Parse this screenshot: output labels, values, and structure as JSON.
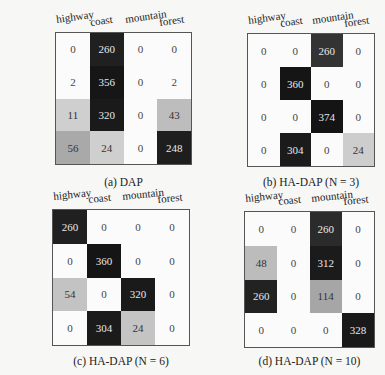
{
  "classes": [
    "highway",
    "coast",
    "mountain",
    "forest"
  ],
  "panels": [
    {
      "caption": "(a) DAP",
      "matrix": [
        [
          0,
          260,
          0,
          0
        ],
        [
          2,
          356,
          0,
          2
        ],
        [
          11,
          320,
          0,
          43
        ],
        [
          56,
          24,
          0,
          248
        ]
      ]
    },
    {
      "caption": "(b) HA-DAP (N = 3)",
      "matrix": [
        [
          0,
          0,
          260,
          0
        ],
        [
          0,
          360,
          0,
          0
        ],
        [
          0,
          0,
          374,
          0
        ],
        [
          0,
          304,
          0,
          24
        ]
      ]
    },
    {
      "caption": "(c) HA-DAP (N = 6)",
      "matrix": [
        [
          260,
          0,
          0,
          0
        ],
        [
          0,
          360,
          0,
          0
        ],
        [
          54,
          0,
          320,
          0
        ],
        [
          0,
          304,
          24,
          0
        ]
      ]
    },
    {
      "caption": "(d) HA-DAP (N = 10)",
      "matrix": [
        [
          0,
          0,
          260,
          0
        ],
        [
          48,
          0,
          312,
          0
        ],
        [
          260,
          0,
          114,
          0
        ],
        [
          0,
          0,
          0,
          328
        ]
      ]
    }
  ],
  "chart_data": [
    {
      "type": "heatmap",
      "title": "(a) DAP",
      "x_labels": [
        "highway",
        "coast",
        "mountain",
        "forest"
      ],
      "y_labels": [
        "highway",
        "coast",
        "mountain",
        "forest"
      ],
      "values": [
        [
          0,
          260,
          0,
          0
        ],
        [
          2,
          356,
          0,
          2
        ],
        [
          11,
          320,
          0,
          43
        ],
        [
          56,
          24,
          0,
          248
        ]
      ],
      "colormap": "gray_r"
    },
    {
      "type": "heatmap",
      "title": "(b) HA-DAP (N = 3)",
      "x_labels": [
        "highway",
        "coast",
        "mountain",
        "forest"
      ],
      "y_labels": [
        "highway",
        "coast",
        "mountain",
        "forest"
      ],
      "values": [
        [
          0,
          0,
          260,
          0
        ],
        [
          0,
          360,
          0,
          0
        ],
        [
          0,
          0,
          374,
          0
        ],
        [
          0,
          304,
          0,
          24
        ]
      ],
      "colormap": "gray_r"
    },
    {
      "type": "heatmap",
      "title": "(c) HA-DAP (N = 6)",
      "x_labels": [
        "highway",
        "coast",
        "mountain",
        "forest"
      ],
      "y_labels": [
        "highway",
        "coast",
        "mountain",
        "forest"
      ],
      "values": [
        [
          260,
          0,
          0,
          0
        ],
        [
          0,
          360,
          0,
          0
        ],
        [
          54,
          0,
          320,
          0
        ],
        [
          0,
          304,
          24,
          0
        ]
      ],
      "colormap": "gray_r"
    },
    {
      "type": "heatmap",
      "title": "(d) HA-DAP (N = 10)",
      "x_labels": [
        "highway",
        "coast",
        "mountain",
        "forest"
      ],
      "y_labels": [
        "highway",
        "coast",
        "mountain",
        "forest"
      ],
      "values": [
        [
          0,
          0,
          260,
          0
        ],
        [
          48,
          0,
          312,
          0
        ],
        [
          260,
          0,
          114,
          0
        ],
        [
          0,
          0,
          0,
          328
        ]
      ],
      "colormap": "gray_r"
    }
  ]
}
